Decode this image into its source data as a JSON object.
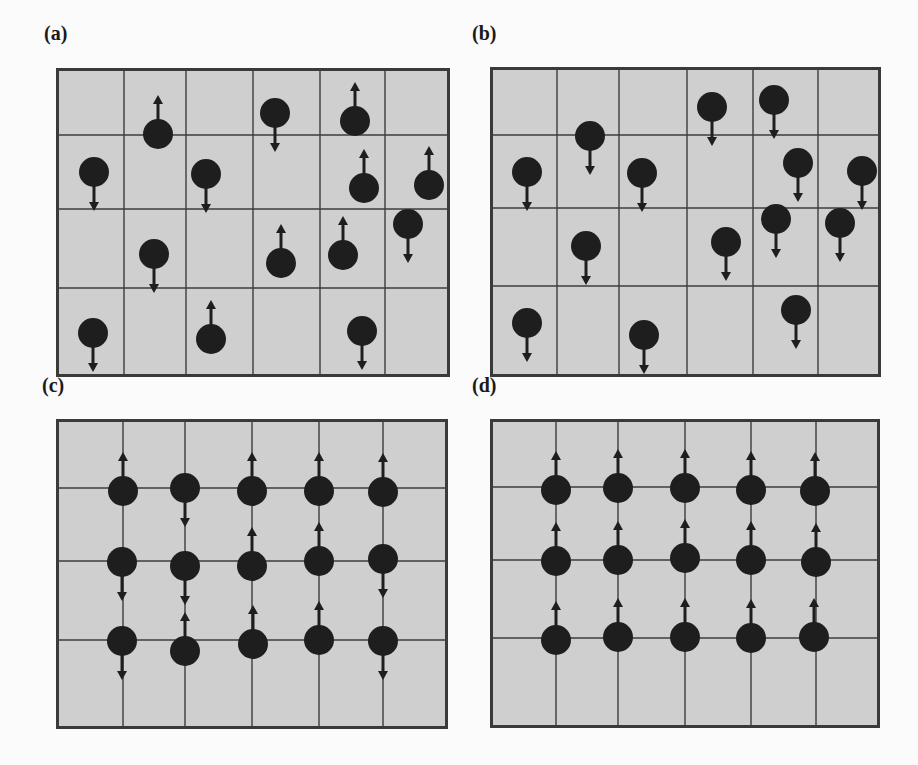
{
  "figure": {
    "panels": [
      {
        "id": "a",
        "label": "(a)",
        "label_pos": [
          44,
          42
        ],
        "box": [
          56,
          68,
          394,
          309
        ],
        "grid_style": "full",
        "vlines": [
          68,
          130,
          197,
          264,
          329
        ],
        "hlines": [
          67,
          141,
          220
        ],
        "dipoles": [
          {
            "x": 102,
            "y": 66,
            "dir": "up"
          },
          {
            "x": 219,
            "y": 45,
            "dir": "down"
          },
          {
            "x": 299,
            "y": 53,
            "dir": "up"
          },
          {
            "x": 38,
            "y": 104,
            "dir": "down"
          },
          {
            "x": 150,
            "y": 106,
            "dir": "down"
          },
          {
            "x": 308,
            "y": 120,
            "dir": "up"
          },
          {
            "x": 373,
            "y": 117,
            "dir": "up"
          },
          {
            "x": 352,
            "y": 156,
            "dir": "down"
          },
          {
            "x": 98,
            "y": 186,
            "dir": "down"
          },
          {
            "x": 225,
            "y": 195,
            "dir": "up"
          },
          {
            "x": 287,
            "y": 187,
            "dir": "up"
          },
          {
            "x": 37,
            "y": 265,
            "dir": "down"
          },
          {
            "x": 155,
            "y": 271,
            "dir": "up"
          },
          {
            "x": 306,
            "y": 263,
            "dir": "down"
          }
        ]
      },
      {
        "id": "b",
        "label": "(b)",
        "label_pos": [
          472,
          42
        ],
        "box": [
          490,
          67,
          391,
          310
        ],
        "grid_style": "full",
        "vlines": [
          67,
          129,
          197,
          263,
          328
        ],
        "hlines": [
          68,
          141,
          219
        ],
        "dipoles": [
          {
            "x": 100,
            "y": 69,
            "dir": "down"
          },
          {
            "x": 222,
            "y": 40,
            "dir": "down"
          },
          {
            "x": 284,
            "y": 33,
            "dir": "down"
          },
          {
            "x": 37,
            "y": 105,
            "dir": "down"
          },
          {
            "x": 152,
            "y": 106,
            "dir": "down"
          },
          {
            "x": 308,
            "y": 96,
            "dir": "down"
          },
          {
            "x": 372,
            "y": 104,
            "dir": "down"
          },
          {
            "x": 286,
            "y": 152,
            "dir": "down"
          },
          {
            "x": 350,
            "y": 156,
            "dir": "down"
          },
          {
            "x": 96,
            "y": 179,
            "dir": "down"
          },
          {
            "x": 236,
            "y": 175,
            "dir": "down"
          },
          {
            "x": 37,
            "y": 256,
            "dir": "down"
          },
          {
            "x": 154,
            "y": 268,
            "dir": "down"
          },
          {
            "x": 306,
            "y": 243,
            "dir": "down"
          }
        ]
      },
      {
        "id": "c",
        "label": "(c)",
        "label_pos": [
          42,
          394
        ],
        "box": [
          56,
          419,
          392,
          310
        ],
        "grid_style": "full",
        "vlines": [
          67,
          129,
          196,
          263,
          327
        ],
        "hlines": [
          69,
          142,
          221
        ],
        "dipoles": [
          {
            "x": 67,
            "y": 72,
            "dir": "up"
          },
          {
            "x": 129,
            "y": 69,
            "dir": "down"
          },
          {
            "x": 196,
            "y": 72,
            "dir": "up"
          },
          {
            "x": 263,
            "y": 72,
            "dir": "up"
          },
          {
            "x": 327,
            "y": 73,
            "dir": "up"
          },
          {
            "x": 66,
            "y": 143,
            "dir": "down"
          },
          {
            "x": 129,
            "y": 147,
            "dir": "down"
          },
          {
            "x": 196,
            "y": 147,
            "dir": "up"
          },
          {
            "x": 263,
            "y": 142,
            "dir": "up"
          },
          {
            "x": 327,
            "y": 140,
            "dir": "down"
          },
          {
            "x": 66,
            "y": 222,
            "dir": "down"
          },
          {
            "x": 129,
            "y": 232,
            "dir": "up"
          },
          {
            "x": 197,
            "y": 225,
            "dir": "up"
          },
          {
            "x": 263,
            "y": 221,
            "dir": "up"
          },
          {
            "x": 327,
            "y": 222,
            "dir": "down"
          }
        ]
      },
      {
        "id": "d",
        "label": "(d)",
        "label_pos": [
          472,
          394
        ],
        "box": [
          490,
          419,
          390,
          309
        ],
        "grid_style": "full",
        "vlines": [
          66,
          128,
          195,
          261,
          326
        ],
        "hlines": [
          68,
          141,
          219
        ],
        "dipoles": [
          {
            "x": 66,
            "y": 71,
            "dir": "up"
          },
          {
            "x": 128,
            "y": 69,
            "dir": "up"
          },
          {
            "x": 195,
            "y": 69,
            "dir": "up"
          },
          {
            "x": 261,
            "y": 71,
            "dir": "up"
          },
          {
            "x": 325,
            "y": 72,
            "dir": "up"
          },
          {
            "x": 66,
            "y": 142,
            "dir": "up"
          },
          {
            "x": 128,
            "y": 141,
            "dir": "up"
          },
          {
            "x": 195,
            "y": 139,
            "dir": "up"
          },
          {
            "x": 261,
            "y": 141,
            "dir": "up"
          },
          {
            "x": 326,
            "y": 143,
            "dir": "up"
          },
          {
            "x": 66,
            "y": 221,
            "dir": "up"
          },
          {
            "x": 128,
            "y": 218,
            "dir": "up"
          },
          {
            "x": 195,
            "y": 218,
            "dir": "up"
          },
          {
            "x": 261,
            "y": 219,
            "dir": "up"
          },
          {
            "x": 324,
            "y": 218,
            "dir": "up"
          }
        ]
      }
    ],
    "style": {
      "panel_fill": "#cfcfcf",
      "panel_border": "#3a3a3a",
      "grid_line": "#3c3c3c",
      "dipole_fill": "#1e1e1e",
      "dipole_radius": 15,
      "arrow_length": 24
    }
  }
}
